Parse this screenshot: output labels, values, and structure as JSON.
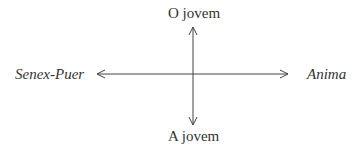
{
  "diagram": {
    "type": "axes-cross",
    "labels": {
      "top": "O jovem",
      "bottom": "A jovem",
      "left": "Senex-Puer",
      "right": "Anima"
    },
    "colors": {
      "ink": "#333333",
      "background": "#ffffff"
    }
  }
}
